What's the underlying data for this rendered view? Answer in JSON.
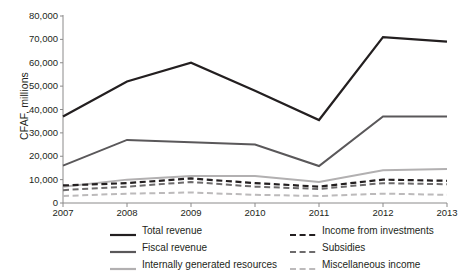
{
  "chart_data": {
    "type": "line",
    "title": "",
    "xlabel": "",
    "ylabel": "CFAF, millions",
    "categories": [
      "2007",
      "2008",
      "2009",
      "2010",
      "2011",
      "2012",
      "2013"
    ],
    "x": [
      2007,
      2008,
      2009,
      2010,
      2011,
      2012,
      2013
    ],
    "ylim": [
      0,
      80000
    ],
    "yticks": [
      0,
      10000,
      20000,
      30000,
      40000,
      50000,
      60000,
      70000,
      80000
    ],
    "ytick_labels": [
      "0",
      "10,000",
      "20,000",
      "30,000",
      "40,000",
      "50,000",
      "60,000",
      "70,000",
      "80,000"
    ],
    "grid": false,
    "legend_position": "below",
    "legend_columns": 2,
    "series": [
      {
        "name": "Total revenue",
        "values": [
          37000,
          52000,
          60000,
          48000,
          35500,
          71000,
          69000
        ],
        "color": "#231f20",
        "style": "solid",
        "width": 2.2
      },
      {
        "name": "Fiscal revenue",
        "values": [
          16000,
          27000,
          26000,
          25000,
          15800,
          37000,
          37000
        ],
        "color": "#5a585a",
        "style": "solid",
        "width": 2.0
      },
      {
        "name": "Internally generated resources",
        "values": [
          7000,
          10000,
          11500,
          11500,
          9000,
          14000,
          14500
        ],
        "color": "#b2b0b1",
        "style": "solid",
        "width": 2.0
      },
      {
        "name": "Income from investments",
        "values": [
          7500,
          8500,
          10500,
          8500,
          7000,
          10000,
          9500
        ],
        "color": "#231f20",
        "style": "dashed",
        "width": 2.2
      },
      {
        "name": "Subsidies",
        "values": [
          5500,
          7000,
          9000,
          7000,
          6000,
          8500,
          8000
        ],
        "color": "#6d6b6c",
        "style": "dashed",
        "width": 2.0
      },
      {
        "name": "Miscellaneous income",
        "values": [
          3000,
          4000,
          4500,
          3500,
          3000,
          4000,
          3500
        ],
        "color": "#bcbabb",
        "style": "dashed",
        "width": 2.0
      }
    ]
  },
  "axis": {
    "y_title": "CFAF, millions"
  },
  "legend": {
    "items": [
      {
        "label": "Total revenue",
        "color": "#231f20",
        "style": "solid"
      },
      {
        "label": "Income from investments",
        "color": "#231f20",
        "style": "dashed"
      },
      {
        "label": "Fiscal revenue",
        "color": "#5a585a",
        "style": "solid"
      },
      {
        "label": "Subsidies",
        "color": "#6d6b6c",
        "style": "dashed"
      },
      {
        "label": "Internally generated resources",
        "color": "#b2b0b1",
        "style": "solid"
      },
      {
        "label": "Miscellaneous income",
        "color": "#bcbabb",
        "style": "dashed"
      }
    ]
  },
  "colors": {
    "axis": "#8b8a8a",
    "text": "#231f20",
    "background": "#ffffff"
  }
}
